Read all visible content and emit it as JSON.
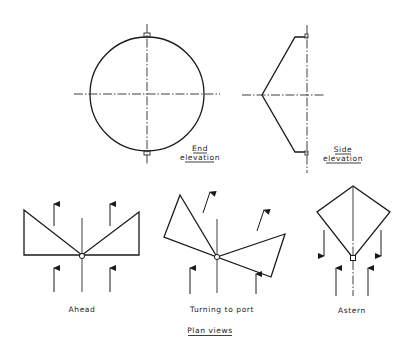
{
  "diagram": {
    "title": "Plan views",
    "end_elevation": {
      "label_line1": "End",
      "label_line2": "elevation"
    },
    "side_elevation": {
      "label_line1": "Side",
      "label_line2": "elevation"
    },
    "plan_views": [
      {
        "label": "Ahead"
      },
      {
        "label": "Turning to port"
      },
      {
        "label": "Astern"
      }
    ]
  }
}
